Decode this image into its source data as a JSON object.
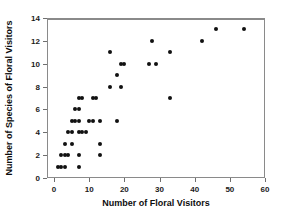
{
  "chart_data": {
    "type": "scatter",
    "title": "",
    "xlabel": "Number of Floral Visitors",
    "ylabel": "Number of Species of Floral Visitors",
    "xlim": [
      -2,
      60
    ],
    "ylim": [
      0,
      14
    ],
    "xticks": [
      0,
      10,
      20,
      30,
      40,
      50,
      60
    ],
    "yticks": [
      0,
      2,
      4,
      6,
      8,
      10,
      12,
      14
    ],
    "xtick_labels": [
      "0",
      "10",
      "20",
      "30",
      "40",
      "50",
      "60"
    ],
    "ytick_labels": [
      "0",
      "2",
      "4",
      "6",
      "8",
      "10",
      "12",
      "14"
    ],
    "grid": false,
    "legend": null,
    "marker": {
      "shape": "circle",
      "color": "#111111",
      "size_px": 4
    },
    "frame_color": "#8a8a8a",
    "background": "#ffffff",
    "n_points": 60,
    "points": [
      [
        1,
        1
      ],
      [
        2,
        1
      ],
      [
        3,
        1
      ],
      [
        7,
        1
      ],
      [
        2,
        2
      ],
      [
        3,
        2
      ],
      [
        4,
        2
      ],
      [
        7,
        2
      ],
      [
        13,
        2
      ],
      [
        3,
        3
      ],
      [
        5,
        3
      ],
      [
        13,
        3
      ],
      [
        4,
        4
      ],
      [
        5,
        4
      ],
      [
        7,
        4
      ],
      [
        8,
        4
      ],
      [
        9,
        4
      ],
      [
        5,
        5
      ],
      [
        6,
        5
      ],
      [
        7,
        5
      ],
      [
        10,
        5
      ],
      [
        11,
        5
      ],
      [
        13,
        5
      ],
      [
        18,
        5
      ],
      [
        6,
        6
      ],
      [
        7,
        6
      ],
      [
        7,
        7
      ],
      [
        8,
        7
      ],
      [
        11,
        7
      ],
      [
        12,
        7
      ],
      [
        33,
        7
      ],
      [
        16,
        8
      ],
      [
        19,
        8
      ],
      [
        18,
        9
      ],
      [
        19,
        10
      ],
      [
        20,
        10
      ],
      [
        27,
        10
      ],
      [
        29,
        10
      ],
      [
        16,
        11
      ],
      [
        33,
        11
      ],
      [
        28,
        12
      ],
      [
        42,
        12
      ],
      [
        46,
        13
      ],
      [
        54,
        13
      ]
    ]
  }
}
